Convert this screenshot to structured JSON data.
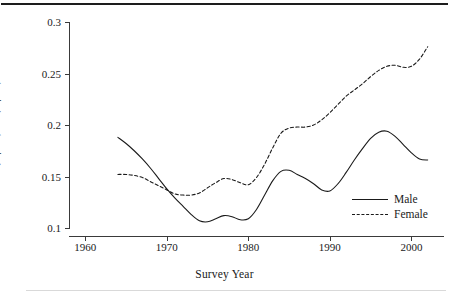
{
  "figure": {
    "background": "#ffffff",
    "line_color": "#1a1a1a",
    "axis_color": "#3a3a3a"
  },
  "chart_data": {
    "type": "line",
    "title": "",
    "xlabel": "Survey Year",
    "ylabel": "Pr(Y|BA)−Pr(Y|HS)",
    "xlim": [
      1958,
      2004
    ],
    "ylim": [
      0.1,
      0.3
    ],
    "xticks": [
      1960,
      1970,
      1980,
      1990,
      2000
    ],
    "xticklabels": [
      "1960",
      "1970",
      "1980",
      "1990",
      "2000"
    ],
    "yticks": [
      0.1,
      0.15,
      0.2,
      0.25,
      0.3
    ],
    "yticklabels": [
      "0.1",
      "0.15",
      "0.2",
      "0.25",
      "0.3"
    ],
    "grid": false,
    "legend_position": "lower right",
    "series": [
      {
        "name": "Male",
        "style": "solid",
        "x": [
          1964,
          1965,
          1966,
          1967,
          1968,
          1969,
          1970,
          1971,
          1972,
          1973,
          1974,
          1975,
          1976,
          1977,
          1978,
          1979,
          1980,
          1981,
          1982,
          1983,
          1984,
          1985,
          1986,
          1987,
          1988,
          1989,
          1990,
          1991,
          1992,
          1993,
          1994,
          1995,
          1996,
          1997,
          1998,
          1999,
          2000,
          2001,
          2002
        ],
        "values": [
          0.188,
          0.182,
          0.175,
          0.167,
          0.158,
          0.148,
          0.138,
          0.129,
          0.121,
          0.113,
          0.107,
          0.106,
          0.109,
          0.112,
          0.111,
          0.108,
          0.109,
          0.118,
          0.132,
          0.146,
          0.155,
          0.156,
          0.152,
          0.148,
          0.143,
          0.137,
          0.136,
          0.143,
          0.154,
          0.166,
          0.177,
          0.187,
          0.193,
          0.194,
          0.189,
          0.181,
          0.173,
          0.167,
          0.166
        ]
      },
      {
        "name": "Female",
        "style": "dashed",
        "x": [
          1964,
          1965,
          1966,
          1967,
          1968,
          1969,
          1970,
          1971,
          1972,
          1973,
          1974,
          1975,
          1976,
          1977,
          1978,
          1979,
          1980,
          1981,
          1982,
          1983,
          1984,
          1985,
          1986,
          1987,
          1988,
          1989,
          1990,
          1991,
          1992,
          1993,
          1994,
          1995,
          1996,
          1997,
          1998,
          1999,
          2000,
          2001,
          2002
        ],
        "values": [
          0.152,
          0.152,
          0.151,
          0.149,
          0.145,
          0.141,
          0.137,
          0.133,
          0.132,
          0.132,
          0.134,
          0.139,
          0.144,
          0.148,
          0.147,
          0.144,
          0.142,
          0.149,
          0.162,
          0.178,
          0.192,
          0.197,
          0.198,
          0.198,
          0.2,
          0.205,
          0.212,
          0.22,
          0.228,
          0.234,
          0.24,
          0.247,
          0.253,
          0.257,
          0.258,
          0.256,
          0.257,
          0.264,
          0.276
        ]
      }
    ]
  },
  "legend": {
    "items": [
      {
        "label": "Male",
        "style": "solid"
      },
      {
        "label": "Female",
        "style": "dashed"
      }
    ]
  }
}
